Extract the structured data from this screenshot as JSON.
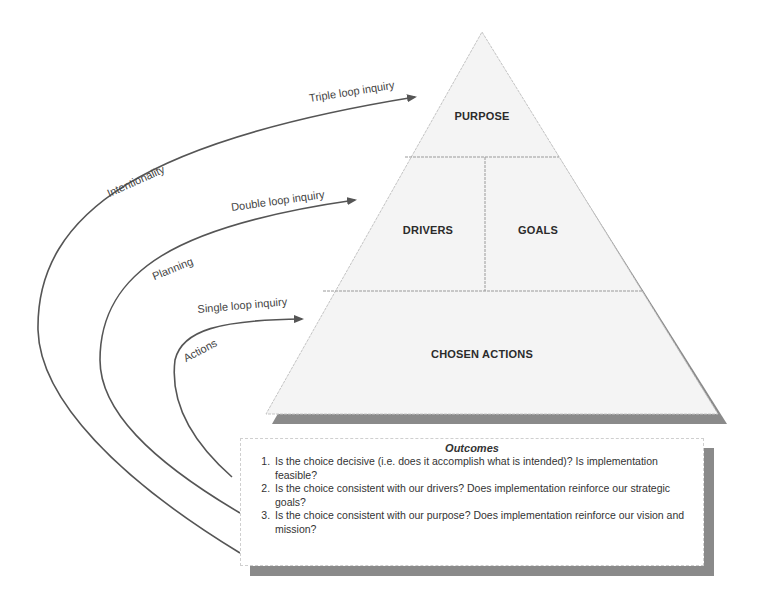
{
  "pyramid": {
    "tiers": {
      "top": "PURPOSE",
      "middle_left": "DRIVERS",
      "middle_right": "GOALS",
      "bottom": "CHOSEN ACTIONS"
    }
  },
  "loops": [
    {
      "arrow_label": "Triple loop inquiry",
      "arc_label": "Intentionality"
    },
    {
      "arrow_label": "Double loop inquiry",
      "arc_label": "Planning"
    },
    {
      "arrow_label": "Single loop inquiry",
      "arc_label": "Actions"
    }
  ],
  "outcomes": {
    "title": "Outcomes",
    "items": [
      "Is the choice decisive (i.e. does it accomplish what is intended)?  Is implementation feasible?",
      "Is the choice consistent with our drivers?  Does implementation reinforce our strategic goals?",
      "Is the choice consistent with our purpose?  Does implementation reinforce our vision and mission?"
    ]
  },
  "colors": {
    "line": "#555555",
    "shadow": "#8a8a8a",
    "pyramid_fill": "#f4f4f4",
    "divider": "#9a9a9a"
  }
}
